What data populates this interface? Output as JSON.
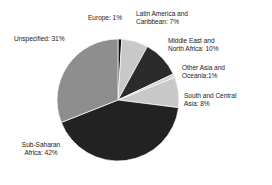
{
  "chart_data": {
    "type": "pie",
    "title": "",
    "subtitle": "",
    "xlabel": "",
    "ylabel": "",
    "legend_position": "none",
    "grid": false,
    "labels_inline": true,
    "start_angle_deg": 0,
    "direction": "clockwise",
    "categories": [
      "Europe",
      "Latin America and Caribbean",
      "Middle East and North Africa",
      "Other Asia and Oceania",
      "South and Central Asia",
      "Sub-Saharan Africa",
      "Unspecified"
    ],
    "values": [
      1,
      7,
      10,
      1,
      8,
      42,
      31
    ],
    "units": "%",
    "colors": [
      "#111111",
      "#c8c8c8",
      "#2b2b2b",
      "#d2d2d2",
      "#c8c8c8",
      "#222222",
      "#8e8e8e"
    ]
  },
  "slices": [
    {
      "key": "europe",
      "name": "Europe",
      "value": 1,
      "color": "#111111",
      "label_text": "Europe: 1%"
    },
    {
      "key": "latin",
      "name": "Latin America and Caribbean",
      "value": 7,
      "color": "#c8c8c8",
      "label_text": "Latin America and\nCaribbean: 7%"
    },
    {
      "key": "middle_east",
      "name": "Middle East and North Africa",
      "value": 10,
      "color": "#2b2b2b",
      "label_text": "Middle East and\nNorth Africa: 10%"
    },
    {
      "key": "other_asia",
      "name": "Other Asia and Oceania",
      "value": 1,
      "color": "#d2d2d2",
      "label_text": "Other Asia and\nOceania:1%"
    },
    {
      "key": "south_asia",
      "name": "South and Central Asia",
      "value": 8,
      "color": "#c8c8c8",
      "label_text": "South and Central\nAsia: 8%"
    },
    {
      "key": "subsaharan",
      "name": "Sub-Saharan Africa",
      "value": 42,
      "color": "#222222",
      "label_text": "Sub-Saharan\nAfrica: 42%"
    },
    {
      "key": "unspecified",
      "name": "Unspecified",
      "value": 31,
      "color": "#8e8e8e",
      "label_text": "Unspecified: 31%"
    }
  ],
  "geometry": {
    "center_x": 118,
    "center_y": 100,
    "radius": 61
  },
  "style": {
    "background": "#ffffff",
    "text_color": "#1b1b1b",
    "slice_outline": "#ffffff"
  }
}
